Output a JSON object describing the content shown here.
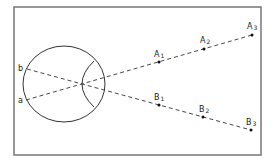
{
  "diagram": {
    "type": "ray-optics-eye",
    "frame": {
      "x": 14,
      "y": 7,
      "width": 247,
      "height": 148,
      "stroke": "#777777"
    },
    "eye": {
      "cx": 64,
      "cy": 84,
      "rx": 41,
      "ry": 38
    },
    "lens": {
      "top": [
        94,
        61
      ],
      "bottom": [
        94,
        107
      ],
      "bulge_x": 82
    },
    "nodal_point": [
      81,
      84
    ],
    "retina_points": [
      {
        "id": "b",
        "label": "b",
        "x": 27,
        "y": 69
      },
      {
        "id": "a",
        "label": "a",
        "x": 26,
        "y": 100
      }
    ],
    "object_points": [
      {
        "id": "A1",
        "base": "A",
        "sub": "1",
        "x": 159,
        "y": 62
      },
      {
        "id": "A2",
        "base": "A",
        "sub": "2",
        "x": 204,
        "y": 49
      },
      {
        "id": "A3",
        "base": "A",
        "sub": "3",
        "x": 252,
        "y": 35
      },
      {
        "id": "B1",
        "base": "B",
        "sub": "1",
        "x": 159,
        "y": 105
      },
      {
        "id": "B2",
        "base": "B",
        "sub": "2",
        "x": 203,
        "y": 117
      },
      {
        "id": "B3",
        "base": "B",
        "sub": "3",
        "x": 251,
        "y": 130
      }
    ],
    "rays": [
      {
        "from": "a",
        "to": "A3",
        "style": "dashed"
      },
      {
        "from": "b",
        "to": "B3",
        "style": "dashed"
      }
    ],
    "labels": {
      "b": "b",
      "a": "a",
      "A1": "A",
      "A1_sub": "1",
      "A2": "A",
      "A2_sub": "2",
      "A3": "A",
      "A3_sub": "3",
      "B1": "B",
      "B1_sub": "1",
      "B2": "B",
      "B2_sub": "2",
      "B3": "B",
      "B3_sub": "3"
    },
    "colors": {
      "line": "#333333",
      "frame": "#777777",
      "background": "#ffffff"
    }
  }
}
